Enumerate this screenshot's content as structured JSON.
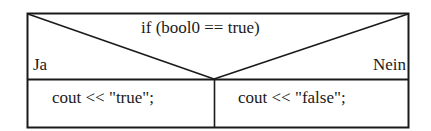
{
  "diagram": {
    "type": "nassi-shneiderman-decision",
    "condition": "if (bool0 == true)",
    "branches": {
      "yes": {
        "label": "Ja",
        "statement": "cout << \"true\";"
      },
      "no": {
        "label": "Nein",
        "statement": "cout << \"false\";"
      }
    },
    "colors": {
      "line": "#1a1a1a",
      "background": "#ffffff"
    }
  }
}
